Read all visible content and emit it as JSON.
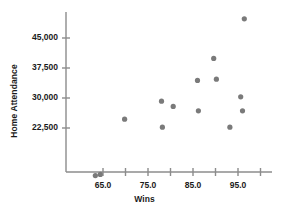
{
  "chart_data": {
    "type": "scatter",
    "title": "",
    "xlabel": "Wins",
    "ylabel": "Home Attendance",
    "xlim": [
      60.5,
      98.5
    ],
    "ylim": [
      8000,
      51500
    ],
    "grid": false,
    "legend": null,
    "marker_color": "#7a7a7a",
    "axis_color": "#8c8c8c",
    "xticks": [
      65.0,
      70.0,
      75.0,
      80.0,
      85.0,
      90.0,
      95.0,
      100.0
    ],
    "xtick_labels": [
      "",
      "65.0",
      "",
      "75.0",
      "",
      "85.0",
      "",
      "95.0",
      ""
    ],
    "xticks_labeled": [
      65.0,
      75.0,
      85.0,
      95.0
    ],
    "xtick_labels_text": [
      "65.0",
      "75.0",
      "85.0",
      "95.0"
    ],
    "yticks": [
      22500,
      30000,
      37500,
      45000
    ],
    "ytick_labels": [
      "22,500",
      "30,000",
      "37,500",
      "45,000"
    ],
    "points": [
      {
        "x": 63.3,
        "y": 10600
      },
      {
        "x": 64.4,
        "y": 10900
      },
      {
        "x": 69.8,
        "y": 24700
      },
      {
        "x": 78.0,
        "y": 29200
      },
      {
        "x": 78.2,
        "y": 22700
      },
      {
        "x": 80.6,
        "y": 27900
      },
      {
        "x": 86.0,
        "y": 34400
      },
      {
        "x": 86.2,
        "y": 26800
      },
      {
        "x": 89.6,
        "y": 39900
      },
      {
        "x": 90.2,
        "y": 34700
      },
      {
        "x": 93.2,
        "y": 22700
      },
      {
        "x": 95.6,
        "y": 30300
      },
      {
        "x": 96.0,
        "y": 26800
      },
      {
        "x": 96.4,
        "y": 49800
      }
    ]
  }
}
